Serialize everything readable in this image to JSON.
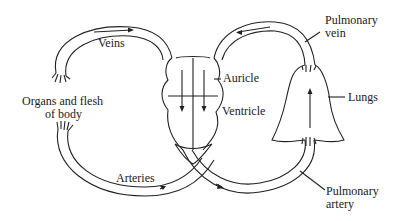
{
  "diagram": {
    "labels": {
      "veins": "Veins",
      "organs_line1": "Organs and flesh",
      "organs_line2": "of body",
      "auricle": "Auricle",
      "ventricle": "Ventricle",
      "arteries": "Arteries",
      "pulmonary_vein_line1": "Pulmonary",
      "pulmonary_vein_line2": "vein",
      "lungs": "Lungs",
      "pulmonary_artery_line1": "Pulmonary",
      "pulmonary_artery_line2": "artery"
    },
    "colors": {
      "stroke": "#222222",
      "background": "#ffffff"
    }
  }
}
